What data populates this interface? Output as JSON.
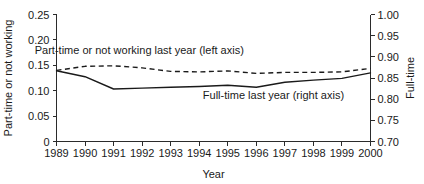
{
  "chart_data": {
    "type": "line",
    "title": "",
    "xlabel": "Year",
    "ylabel": "Part-time or not working",
    "y2label": "Full-time",
    "x": [
      1989,
      1990,
      1991,
      1992,
      1993,
      1994,
      1995,
      1996,
      1997,
      1998,
      1999,
      2000
    ],
    "xlim": [
      1989,
      2000
    ],
    "ylim": [
      0,
      0.25
    ],
    "y2lim": [
      0.7,
      1.0
    ],
    "yticks": [
      "0",
      "0.05",
      "0.10",
      "0.15",
      "0.20",
      "0.25"
    ],
    "ytick_values": [
      0,
      0.05,
      0.1,
      0.15,
      0.2,
      0.25
    ],
    "y2ticks": [
      "0.70",
      "0.75",
      "0.80",
      "0.85",
      "0.90",
      "0.95",
      "1.00"
    ],
    "y2tick_values": [
      0.7,
      0.75,
      0.8,
      0.85,
      0.9,
      0.95,
      1.0
    ],
    "xticks": [
      "1989",
      "1990",
      "1991",
      "1992",
      "1993",
      "1994",
      "1995",
      "1996",
      "1997",
      "1998",
      "1999",
      "2000"
    ],
    "grid": false,
    "legend_position": "inline-annotation",
    "series": [
      {
        "name": "Part-time or not working last year (left axis)",
        "axis": "left",
        "style": "dashed",
        "color": "#1a1a1a",
        "values": [
          0.14,
          0.148,
          0.149,
          0.145,
          0.138,
          0.137,
          0.139,
          0.134,
          0.136,
          0.136,
          0.137,
          0.144
        ]
      },
      {
        "name": "Full-time last year (right axis)",
        "axis": "right",
        "style": "solid",
        "color": "#1a1a1a",
        "values": [
          0.867,
          0.853,
          0.824,
          0.826,
          0.828,
          0.83,
          0.833,
          0.828,
          0.84,
          0.845,
          0.849,
          0.862
        ]
      }
    ],
    "annotations": [
      {
        "text": "Part-time or not working last year (left axis)",
        "x": 1991.9,
        "y": 0.172,
        "anchor": "middle"
      },
      {
        "text": "Full-time last year (right axis)",
        "x": 1996.6,
        "y": 0.083,
        "anchor": "middle"
      }
    ]
  }
}
